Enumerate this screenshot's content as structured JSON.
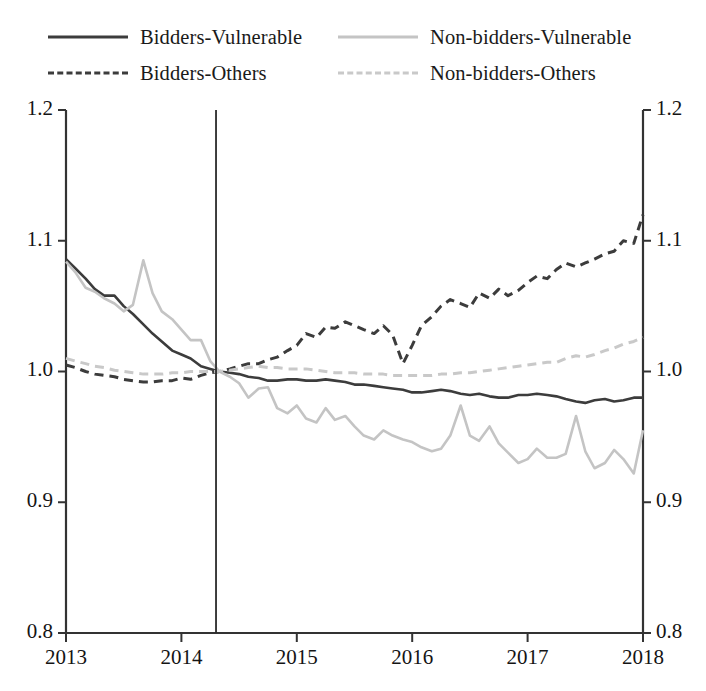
{
  "legend": {
    "items": [
      {
        "label": "Bidders-Vulnerable",
        "style": "solid",
        "color": "#3c3c3c",
        "key": "k-solid-dark"
      },
      {
        "label": "Non-bidders-Vulnerable",
        "style": "solid",
        "color": "#c4c4c4",
        "key": "k-solid-light"
      },
      {
        "label": "Bidders-Others",
        "style": "dashed",
        "color": "#3c3c3c",
        "key": "k-dash-dark"
      },
      {
        "label": "Non-bidders-Others",
        "style": "dashed",
        "color": "#c9c9c9",
        "key": "k-dash-light"
      }
    ]
  },
  "axes": {
    "y_ticks": [
      "1.2",
      "1.1",
      "1.0",
      "0.9",
      "0.8"
    ],
    "y_ticks_right": [
      "1.2",
      "1.1",
      "1.0",
      "0.9",
      "0.8"
    ],
    "x_ticks": [
      "2013",
      "2014",
      "2015",
      "2016",
      "2017",
      "2018"
    ]
  },
  "chart_data": {
    "type": "line",
    "title": "",
    "xlabel": "",
    "ylabel": "",
    "xlim": [
      2013,
      2018
    ],
    "ylim": [
      0.8,
      1.2
    ],
    "yticks": [
      0.8,
      0.9,
      1.0,
      1.1,
      1.2
    ],
    "xticks": [
      2013,
      2014,
      2015,
      2016,
      2017,
      2018
    ],
    "grid": false,
    "legend_position": "above-plot",
    "annotations": [
      {
        "type": "vline",
        "x": 2014.3,
        "label": "",
        "color": "#2a2a2a"
      }
    ],
    "x": [
      2013.0,
      2013.08,
      2013.17,
      2013.25,
      2013.33,
      2013.42,
      2013.5,
      2013.58,
      2013.67,
      2013.75,
      2013.83,
      2013.92,
      2014.0,
      2014.08,
      2014.17,
      2014.25,
      2014.33,
      2014.42,
      2014.5,
      2014.58,
      2014.67,
      2014.75,
      2014.83,
      2014.92,
      2015.0,
      2015.08,
      2015.17,
      2015.25,
      2015.33,
      2015.42,
      2015.5,
      2015.58,
      2015.67,
      2015.75,
      2015.83,
      2015.92,
      2016.0,
      2016.08,
      2016.17,
      2016.25,
      2016.33,
      2016.42,
      2016.5,
      2016.58,
      2016.67,
      2016.75,
      2016.83,
      2016.92,
      2017.0,
      2017.08,
      2017.17,
      2017.25,
      2017.33,
      2017.42,
      2017.5,
      2017.58,
      2017.67,
      2017.75,
      2017.83,
      2017.92,
      2018.0
    ],
    "series": [
      {
        "name": "Bidders-Vulnerable",
        "style": "solid",
        "color": "#3c3c3c",
        "values": [
          1.086,
          1.079,
          1.071,
          1.063,
          1.058,
          1.058,
          1.05,
          1.044,
          1.036,
          1.029,
          1.023,
          1.016,
          1.013,
          1.01,
          1.004,
          1.002,
          1.0,
          0.999,
          0.998,
          0.996,
          0.995,
          0.993,
          0.993,
          0.994,
          0.994,
          0.993,
          0.993,
          0.994,
          0.993,
          0.992,
          0.99,
          0.99,
          0.989,
          0.988,
          0.987,
          0.986,
          0.984,
          0.984,
          0.985,
          0.986,
          0.985,
          0.983,
          0.982,
          0.983,
          0.981,
          0.98,
          0.98,
          0.982,
          0.982,
          0.983,
          0.982,
          0.981,
          0.979,
          0.977,
          0.976,
          0.978,
          0.979,
          0.977,
          0.978,
          0.98,
          0.98
        ]
      },
      {
        "name": "Non-bidders-Vulnerable",
        "style": "solid",
        "color": "#c4c4c4",
        "values": [
          1.084,
          1.076,
          1.064,
          1.061,
          1.056,
          1.052,
          1.046,
          1.051,
          1.085,
          1.06,
          1.046,
          1.04,
          1.032,
          1.024,
          1.024,
          1.008,
          1.0,
          0.996,
          0.991,
          0.98,
          0.987,
          0.988,
          0.972,
          0.968,
          0.974,
          0.964,
          0.961,
          0.972,
          0.963,
          0.966,
          0.958,
          0.951,
          0.948,
          0.955,
          0.951,
          0.948,
          0.946,
          0.942,
          0.939,
          0.941,
          0.951,
          0.974,
          0.951,
          0.947,
          0.958,
          0.945,
          0.938,
          0.93,
          0.933,
          0.941,
          0.934,
          0.934,
          0.937,
          0.966,
          0.939,
          0.926,
          0.93,
          0.94,
          0.933,
          0.922,
          0.955
        ]
      },
      {
        "name": "Bidders-Others",
        "style": "dashed",
        "color": "#3c3c3c",
        "values": [
          1.005,
          1.003,
          1.0,
          0.998,
          0.997,
          0.996,
          0.994,
          0.993,
          0.992,
          0.992,
          0.993,
          0.993,
          0.995,
          0.994,
          0.997,
          0.999,
          1.0,
          1.002,
          1.004,
          1.006,
          1.006,
          1.009,
          1.011,
          1.016,
          1.02,
          1.029,
          1.026,
          1.034,
          1.033,
          1.038,
          1.035,
          1.032,
          1.029,
          1.035,
          1.028,
          1.006,
          1.02,
          1.035,
          1.042,
          1.05,
          1.055,
          1.052,
          1.049,
          1.06,
          1.056,
          1.063,
          1.058,
          1.062,
          1.068,
          1.073,
          1.071,
          1.078,
          1.083,
          1.08,
          1.083,
          1.086,
          1.09,
          1.092,
          1.1,
          1.098,
          1.12
        ]
      },
      {
        "name": "Non-bidders-Others",
        "style": "dashed",
        "color": "#c9c9c9",
        "values": [
          1.01,
          1.008,
          1.006,
          1.004,
          1.003,
          1.001,
          1.0,
          0.999,
          0.998,
          0.998,
          0.998,
          0.999,
          0.999,
          1.0,
          1.0,
          1.0,
          1.0,
          1.001,
          1.002,
          1.003,
          1.004,
          1.003,
          1.003,
          1.002,
          1.002,
          1.002,
          1.001,
          1.0,
          0.999,
          0.999,
          0.999,
          0.998,
          0.998,
          0.998,
          0.997,
          0.997,
          0.997,
          0.997,
          0.997,
          0.998,
          0.998,
          0.999,
          0.999,
          1.0,
          1.001,
          1.002,
          1.003,
          1.004,
          1.005,
          1.006,
          1.007,
          1.007,
          1.01,
          1.012,
          1.011,
          1.013,
          1.016,
          1.018,
          1.021,
          1.023,
          1.026
        ]
      }
    ]
  }
}
